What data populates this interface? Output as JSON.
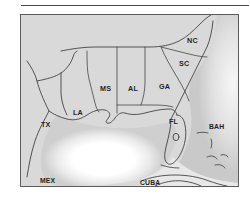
{
  "figure": {
    "kind": "scanned-reference-map",
    "rule_present": true
  },
  "map": {
    "title": "Southeastern United States and Gulf of Mexico",
    "frame": {
      "x": 20,
      "y": 14,
      "width": 217,
      "height": 171
    },
    "colors": {
      "land": "#d9d9d9",
      "land_outline": "#3a3a3a",
      "state_border": "#454545",
      "shelf_water": "#c6c6c6",
      "deep_water": "#ffffff",
      "frame": "#5b5b5b",
      "label_text": "#1d1d1d",
      "rule": "#4a4a4a"
    },
    "labels": [
      {
        "id": "nc",
        "text": "NC",
        "x": 166,
        "y": 22,
        "kind": "state"
      },
      {
        "id": "sc",
        "text": "SC",
        "x": 158,
        "y": 45,
        "kind": "state"
      },
      {
        "id": "ga",
        "text": "GA",
        "x": 138,
        "y": 68,
        "kind": "state"
      },
      {
        "id": "al",
        "text": "AL",
        "x": 107,
        "y": 70,
        "kind": "state"
      },
      {
        "id": "ms",
        "text": "MS",
        "x": 79,
        "y": 70,
        "kind": "state"
      },
      {
        "id": "la",
        "text": "LA",
        "x": 52,
        "y": 94,
        "kind": "state"
      },
      {
        "id": "tx",
        "text": "TX",
        "x": 20,
        "y": 106,
        "kind": "state"
      },
      {
        "id": "fl",
        "text": "FL",
        "x": 148,
        "y": 103,
        "kind": "state"
      },
      {
        "id": "bah",
        "text": "BAH",
        "x": 188,
        "y": 109,
        "kind": "country"
      },
      {
        "id": "mex",
        "text": "MEX",
        "x": 19,
        "y": 163,
        "kind": "country"
      },
      {
        "id": "cuba",
        "text": "CUBA",
        "x": 119,
        "y": 165,
        "kind": "country"
      }
    ],
    "features": {
      "water_body": "Gulf of Mexico",
      "lake": "Lake Okeechobee",
      "island_groups": [
        "Bahamas islands",
        "Florida Keys"
      ],
      "delta": "Mississippi River Delta"
    }
  }
}
